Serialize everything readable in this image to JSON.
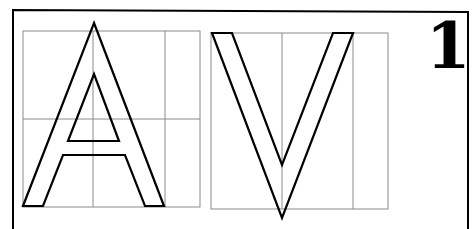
{
  "plate": {
    "number": "1",
    "letters": [
      "A",
      "V"
    ]
  },
  "colors": {
    "stroke": "#000000",
    "grid": "#8a8a8a",
    "background": "#ffffff"
  }
}
